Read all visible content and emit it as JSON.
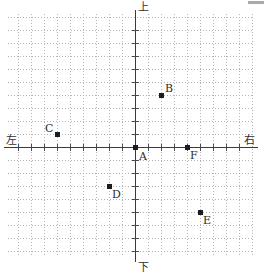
{
  "header": {
    "clipped_text": "· ···· ···· ··· ··· ···· ··· ···· ···",
    "corner_mark": "corner-mark"
  },
  "figure": {
    "title": "",
    "axis_labels": {
      "top": "上",
      "bottom": "下",
      "left": "左",
      "right": "右"
    }
  },
  "chart_data": {
    "type": "scatter",
    "title": "",
    "xlabel": "",
    "ylabel": "",
    "grid": true,
    "grid_spacing": 13,
    "legend": "none",
    "axis_direction_labels": {
      "positive_y": "上",
      "negative_y": "下",
      "negative_x": "左",
      "positive_x": "右"
    },
    "origin_px": {
      "x": 135,
      "y": 147
    },
    "xlim": [
      -10,
      10
    ],
    "ylim": [
      -8,
      10
    ],
    "points": [
      {
        "label": "A",
        "x": 0,
        "y": 0,
        "px": 135,
        "py": 147,
        "label_dx": 4,
        "label_dy": 4
      },
      {
        "label": "B",
        "x": 2,
        "y": 4,
        "px": 161,
        "py": 95,
        "label_dx": 4,
        "label_dy": -12
      },
      {
        "label": "C",
        "x": -6,
        "y": 1,
        "px": 57,
        "py": 134,
        "label_dx": -12,
        "label_dy": -11
      },
      {
        "label": "D",
        "x": -2,
        "y": -3,
        "px": 109,
        "py": 186,
        "label_dx": 3,
        "label_dy": 3
      },
      {
        "label": "E",
        "x": 5,
        "y": -5,
        "px": 200,
        "py": 212,
        "label_dx": 3,
        "label_dy": 3
      },
      {
        "label": "F",
        "x": 4,
        "y": 0,
        "px": 187,
        "py": 147,
        "label_dx": 3,
        "label_dy": 3
      }
    ]
  },
  "colors": {
    "grid": "#b4b4b8",
    "axis": "#3a3a3e",
    "point": "#1d1d20",
    "text": "#2b2b2f",
    "background": "#ffffff"
  }
}
